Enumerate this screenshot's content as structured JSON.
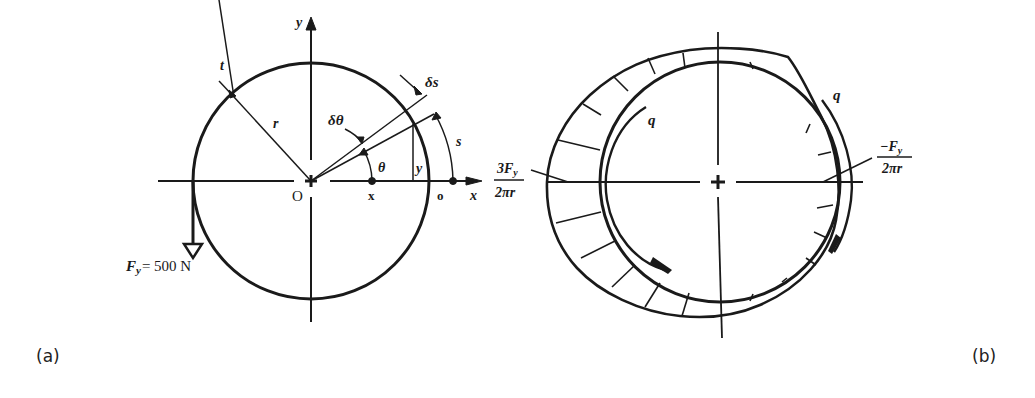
{
  "figure_a": {
    "caption": "(a)",
    "axis_x_label": "x",
    "axis_y_label": "y",
    "origin_label": "O",
    "point_x_label": "x",
    "point_o_label": "o",
    "thickness_label": "t",
    "radius_label": "r",
    "arc_length_label": "s",
    "element_length_label": "δs",
    "element_angle_label": "δθ",
    "angle_label": "θ",
    "height_label": "y",
    "force_label": "F",
    "force_subscript": "y",
    "force_value": "= 500 N"
  },
  "figure_b": {
    "caption": "(b)",
    "shear_flow_label_left": "q",
    "shear_flow_label_right": "q",
    "max_value_numerator": "3F",
    "max_value_numerator_sub": "y",
    "max_value_denominator": "2πr",
    "min_value_numerator": "−F",
    "min_value_numerator_sub": "y",
    "min_value_denominator": "2πr"
  }
}
